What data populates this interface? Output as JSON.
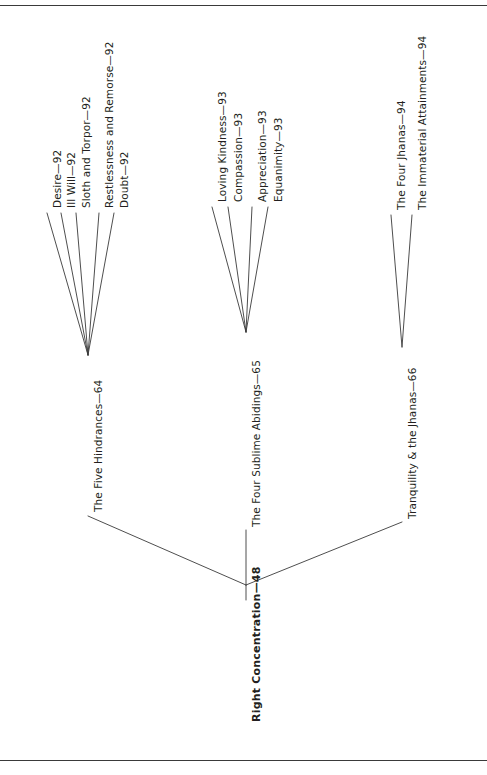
{
  "figure": {
    "orientation": "rotated-90-ccw",
    "line_color": "#3a3a3a",
    "text_color": "#231f20",
    "frame": {
      "top_rule": true,
      "bottom_rule": true
    }
  },
  "tree": {
    "root": {
      "label": "Right Concentration—48",
      "bold": true
    },
    "branches": [
      {
        "label": "The Five Hindrances—64",
        "leaves": [
          {
            "label": "Desire—92"
          },
          {
            "label": "Ill Will—92"
          },
          {
            "label": "Sloth and Torpor—92"
          },
          {
            "label": "Restlessness and Remorse—92"
          },
          {
            "label": "Doubt—92"
          }
        ]
      },
      {
        "label": "The Four Sublime Abidings—65",
        "leaves": [
          {
            "label": "Loving Kindness—93"
          },
          {
            "label": "Compassion—93"
          },
          {
            "label": "Appreciation—93"
          },
          {
            "label": "Equanimity—93"
          }
        ]
      },
      {
        "label": "Tranquility & the Jhanas—66",
        "leaves": [
          {
            "label": "The Four Jhanas—94"
          },
          {
            "label": "The Immaterial Attainments—94"
          }
        ]
      }
    ]
  }
}
